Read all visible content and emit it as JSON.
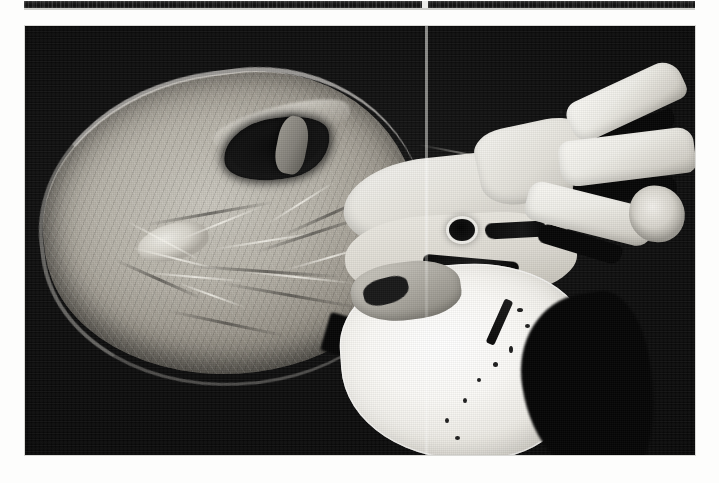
{
  "page": {
    "background_color": "#fdfdfc",
    "width": 719,
    "height": 483,
    "kind": "scanned-book-page"
  },
  "top_strip": {
    "name": "partial-figure-above",
    "description": "bottom sliver of the preceding photographic figure",
    "color": "#121212",
    "left": 24,
    "top": 1,
    "width": 671,
    "height": 9
  },
  "figure": {
    "caption": "",
    "alt_text": "Grayscale photograph of a dissected heart specimen shown in longitudinal section against a black background",
    "frame": {
      "left": 25,
      "top": 26,
      "width": 670,
      "height": 429,
      "background_color": "#060606",
      "border_color": "#d9d9d6"
    },
    "modality": "gross pathology photograph",
    "color_mode": "grayscale"
  },
  "artifacts": {
    "scan_line": {
      "name": "vertical-scan-line",
      "x": 400,
      "width": 2.5,
      "color": "#bebeba"
    },
    "grain": "film-grain-halftone"
  },
  "specimen": {
    "regions": [
      {
        "id": "lv-chamber",
        "label": "left ventricular chamber",
        "tone": "mid-gray"
      },
      {
        "id": "cavity",
        "label": "dark outflow cavity",
        "tone": "black"
      },
      {
        "id": "papillary",
        "label": "papillary muscle",
        "tone": "bright-gray"
      },
      {
        "id": "septum",
        "label": "septal / valve plane",
        "tone": "bright"
      },
      {
        "id": "ostium",
        "label": "round orifice",
        "tone": "black"
      },
      {
        "id": "vessels",
        "label": "great vessel branches",
        "tone": "white"
      },
      {
        "id": "bright-mass",
        "label": "bright lower mass",
        "tone": "white"
      }
    ],
    "chordae_count": 9,
    "trabeculae_count": 7,
    "speck_count": 8
  }
}
